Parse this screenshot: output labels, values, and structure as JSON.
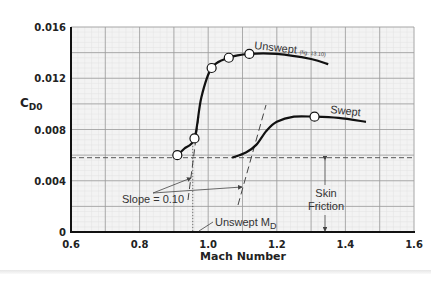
{
  "chart_data": {
    "type": "line",
    "title": "",
    "xlabel": "Mach Number",
    "ylabel": "CD0",
    "ylabel_main": "C",
    "ylabel_sub": "D0",
    "xlim": [
      0.6,
      1.6
    ],
    "ylim": [
      0,
      0.016
    ],
    "x_ticks": [
      "0.6",
      "0.8",
      "1.0",
      "1.2",
      "1.4",
      "1.6"
    ],
    "y_ticks": [
      "0",
      "0.004",
      "0.008",
      "0.012",
      "0.016"
    ],
    "grid": true,
    "series": [
      {
        "name": "Unswept",
        "note": "(fig. 13.10)",
        "x": [
          0.91,
          0.93,
          0.96,
          0.98,
          1.01,
          1.06,
          1.12,
          1.2,
          1.3,
          1.35
        ],
        "y": [
          0.006,
          0.0065,
          0.0073,
          0.0105,
          0.0128,
          0.0136,
          0.0139,
          0.0139,
          0.0135,
          0.0131
        ],
        "markers": [
          [
            0.91,
            0.006
          ],
          [
            0.96,
            0.0073
          ],
          [
            1.01,
            0.0128
          ],
          [
            1.06,
            0.0136
          ],
          [
            1.12,
            0.0139
          ]
        ]
      },
      {
        "name": "Swept",
        "x": [
          1.07,
          1.11,
          1.14,
          1.17,
          1.2,
          1.25,
          1.31,
          1.38,
          1.46
        ],
        "y": [
          0.0058,
          0.0062,
          0.0068,
          0.0079,
          0.0086,
          0.009,
          0.009,
          0.0089,
          0.0086
        ],
        "markers": [
          [
            1.31,
            0.009
          ]
        ]
      }
    ],
    "reference_lines": {
      "skin_friction_level": 0.0058,
      "unswept_MD": 0.955
    },
    "annotations": {
      "slope": "Slope = 0.10",
      "unswept_md_main": "Unswept M",
      "unswept_md_sub": "D",
      "skin_friction_line1": "Skin",
      "skin_friction_line2": "Friction",
      "unswept_label": "Unswept",
      "unswept_note": "(fig. 13.10)",
      "swept_label": "Swept"
    }
  }
}
